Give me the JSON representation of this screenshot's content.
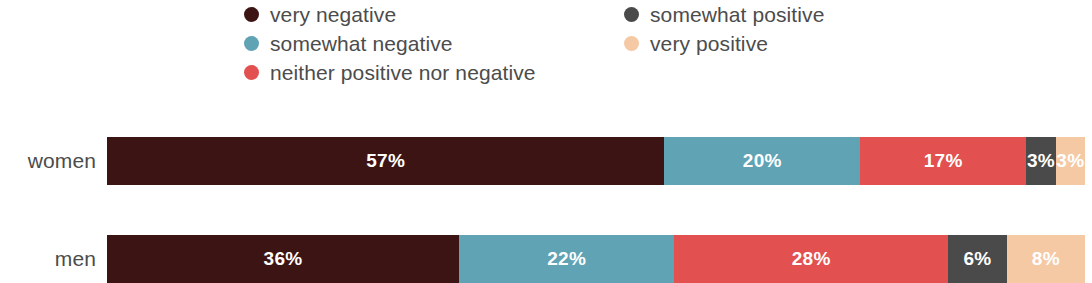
{
  "legend": {
    "columns": [
      {
        "items": [
          {
            "label": "very negative",
            "color": "#3d1414",
            "icon": "legend-dot-icon"
          },
          {
            "label": "somewhat negative",
            "color": "#5fa3b5",
            "icon": "legend-dot-icon"
          },
          {
            "label": "neither positive nor negative",
            "color": "#e2504f",
            "icon": "legend-dot-icon"
          }
        ]
      },
      {
        "items": [
          {
            "label": "somewhat positive",
            "color": "#4a4a4a",
            "icon": "legend-dot-icon"
          },
          {
            "label": "very positive",
            "color": "#f5c9a4",
            "icon": "legend-dot-icon"
          }
        ]
      }
    ]
  },
  "rows": [
    {
      "label": "women",
      "segments": [
        {
          "category": "very negative",
          "value": 57,
          "display": "57%",
          "color": "#3d1414"
        },
        {
          "category": "somewhat negative",
          "value": 20,
          "display": "20%",
          "color": "#5fa3b5"
        },
        {
          "category": "neither positive nor negative",
          "value": 17,
          "display": "17%",
          "color": "#e2504f"
        },
        {
          "category": "somewhat positive",
          "value": 3,
          "display": "3%",
          "color": "#4a4a4a"
        },
        {
          "category": "very positive",
          "value": 3,
          "display": "3%",
          "color": "#f5c9a4"
        }
      ]
    },
    {
      "label": "men",
      "segments": [
        {
          "category": "very negative",
          "value": 36,
          "display": "36%",
          "color": "#3d1414"
        },
        {
          "category": "somewhat negative",
          "value": 22,
          "display": "22%",
          "color": "#5fa3b5"
        },
        {
          "category": "neither positive nor negative",
          "value": 28,
          "display": "28%",
          "color": "#e2504f"
        },
        {
          "category": "somewhat positive",
          "value": 6,
          "display": "6%",
          "color": "#4a4a4a"
        },
        {
          "category": "very positive",
          "value": 8,
          "display": "8%",
          "color": "#f5c9a4"
        }
      ]
    }
  ],
  "chart_data": {
    "type": "bar",
    "title": "",
    "subtitle": "",
    "xlabel": "",
    "ylabel": "",
    "orientation": "horizontal",
    "stacked": true,
    "normalized": true,
    "grid": false,
    "legend_position": "top",
    "xlim": [
      0,
      100
    ],
    "categories": [
      "women",
      "men"
    ],
    "series": [
      {
        "name": "very negative",
        "color": "#3d1414",
        "values": [
          57,
          36
        ]
      },
      {
        "name": "somewhat negative",
        "color": "#5fa3b5",
        "values": [
          20,
          22
        ]
      },
      {
        "name": "neither positive nor negative",
        "color": "#e2504f",
        "values": [
          17,
          28
        ]
      },
      {
        "name": "somewhat positive",
        "color": "#4a4a4a",
        "values": [
          3,
          6
        ]
      },
      {
        "name": "very positive",
        "color": "#f5c9a4",
        "values": [
          3,
          8
        ]
      }
    ],
    "data_labels": [
      [
        "57%",
        "20%",
        "17%",
        "3%",
        "3%"
      ],
      [
        "36%",
        "22%",
        "28%",
        "6%",
        "8%"
      ]
    ]
  }
}
